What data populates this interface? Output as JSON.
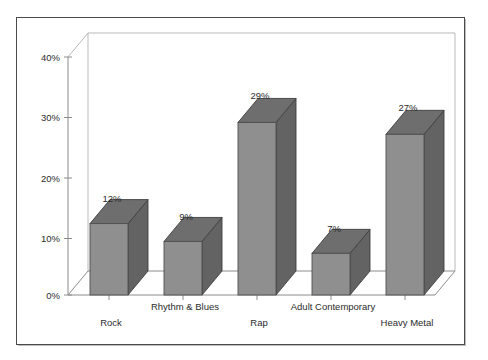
{
  "chart_data": {
    "type": "bar",
    "title": "",
    "subtitle": "",
    "xlabel": "",
    "ylabel": "",
    "categories": [
      "Rock",
      "Rhythm & Blues",
      "Rap",
      "Adult Contemporary",
      "Heavy Metal"
    ],
    "values": [
      12,
      9,
      29,
      7,
      27
    ],
    "data_labels": [
      "12%",
      "9%",
      "29%",
      "7%",
      "27%"
    ],
    "ylim": [
      0,
      40
    ],
    "ytick_values": [
      0,
      10,
      20,
      30,
      40
    ],
    "ytick_labels": [
      "0%",
      "10%",
      "20%",
      "30%",
      "40%"
    ],
    "grid": false,
    "legend": "none",
    "three_d": true,
    "colors": {
      "bar_front": "#8f8f8f",
      "bar_side": "#636363",
      "bar_top": "#6e6e6e",
      "bar_outline": "#3f3f3f",
      "axis": "#8c8c8c",
      "wall": "#b9b9b9",
      "frame": "#4a4a4a",
      "background": "#ffffff",
      "text": "#2b2b2b"
    }
  },
  "axis": {
    "y_labels": [
      {
        "text": "40%",
        "x": 62,
        "y": 57
      },
      {
        "text": "30%",
        "x": 62,
        "y": 117.5
      },
      {
        "text": "20%",
        "x": 62,
        "y": 178
      },
      {
        "text": "10%",
        "x": 62,
        "y": 238.5
      },
      {
        "text": "0%",
        "x": 62,
        "y": 298
      }
    ]
  },
  "bars": [
    {
      "name": "rock",
      "label": "12%",
      "value": 12,
      "x": 90,
      "w": 38,
      "label_x": 112,
      "label_y": 202,
      "cat_x": 111,
      "cat_y": 326,
      "cat_label": "Rock"
    },
    {
      "name": "rhythm-and-blues",
      "label": "9%",
      "value": 9,
      "x": 164,
      "w": 38,
      "label_x": 186,
      "label_y": 220,
      "cat_x": 185,
      "cat_y": 310,
      "cat_label": "Rhythm & Blues"
    },
    {
      "name": "rap",
      "label": "29%",
      "value": 29,
      "x": 238,
      "w": 38,
      "label_x": 260,
      "label_y": 99,
      "cat_x": 259,
      "cat_y": 326,
      "cat_label": "Rap"
    },
    {
      "name": "adult-contemporary",
      "label": "7%",
      "value": 7,
      "x": 312,
      "w": 38,
      "label_x": 334,
      "label_y": 232,
      "cat_x": 333,
      "cat_y": 310,
      "cat_label": "Adult Contemporary"
    },
    {
      "name": "heavy-metal",
      "label": "27%",
      "value": 27,
      "x": 386,
      "w": 38,
      "label_x": 408,
      "label_y": 111,
      "cat_x": 407,
      "cat_y": 326,
      "cat_label": "Heavy Metal"
    }
  ]
}
